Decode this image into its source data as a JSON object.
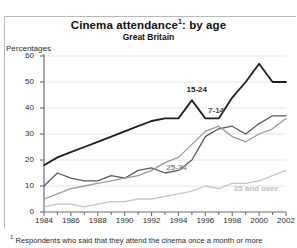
{
  "chart_data": {
    "type": "line",
    "title_main": "Cinema attendance",
    "title_sup": "1",
    "title_tail": ": by age",
    "subtitle": "Great Britain",
    "ylabel": "Percentages",
    "xlabel": "",
    "ylim": [
      0,
      60
    ],
    "xlim": [
      1984,
      2002
    ],
    "grid": true,
    "legend_position": "inline-labels",
    "yticks": [
      0,
      10,
      20,
      30,
      40,
      50,
      60
    ],
    "xticks": [
      1984,
      1986,
      1988,
      1990,
      1992,
      1994,
      1996,
      1998,
      2000,
      2002
    ],
    "x": [
      1984,
      1985,
      1986,
      1987,
      1988,
      1989,
      1990,
      1991,
      1992,
      1993,
      1994,
      1995,
      1996,
      1997,
      1998,
      1999,
      2000,
      2001,
      2002
    ],
    "series": [
      {
        "name": "15-24",
        "color": "#1f1f1f",
        "width": 1.8,
        "label_x": 1994.6,
        "label_y": 47,
        "values": [
          18,
          21,
          23,
          25,
          27,
          29,
          31,
          33,
          35,
          36,
          36,
          43,
          36,
          36,
          44,
          50,
          57,
          50,
          50
        ]
      },
      {
        "name": "7-14",
        "color": "#5a5a5a",
        "width": 1.3,
        "label_x": 1996.2,
        "label_y": 39,
        "values": [
          10,
          15,
          13,
          12,
          12,
          14,
          13,
          16,
          17,
          15,
          16,
          20,
          29,
          32,
          33,
          30,
          34,
          37,
          37
        ]
      },
      {
        "name": "25-34",
        "color": "#9a9a9a",
        "width": 1.3,
        "label_x": 1993.1,
        "label_y": 17,
        "values": [
          5,
          7,
          9,
          10,
          11,
          12,
          13,
          14,
          16,
          19,
          21,
          26,
          31,
          33,
          29,
          27,
          30,
          32,
          36
        ]
      },
      {
        "name": "35 and over",
        "color": "#c4c4c4",
        "width": 1.3,
        "label_x": 1998.1,
        "label_y": 9,
        "values": [
          2,
          3,
          3,
          2,
          3,
          4,
          4,
          5,
          5,
          6,
          7,
          8,
          10,
          9,
          11,
          11,
          12,
          14,
          16
        ]
      }
    ],
    "footnote_sup": "1",
    "footnote": "Respondents who said that they attend the cinema once a month or more"
  }
}
